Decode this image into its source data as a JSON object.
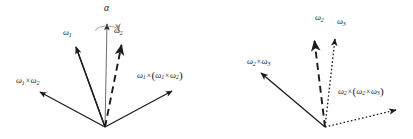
{
  "figure": {
    "background_color": "#ffffff",
    "ink_color": "#1a1a1a",
    "width": 413,
    "height": 139,
    "panels": [
      {
        "id": "left-panel",
        "origin": [
          105,
          127
        ],
        "axis": {
          "name": "alpha-axis",
          "label": "α",
          "tip": [
            107,
            22
          ],
          "style": "solid",
          "rotation_arc": true
        },
        "vectors": [
          {
            "name": "omega-1",
            "label_html": "ω<sub>1</sub>",
            "label_text": "ω1",
            "tip": [
              75,
              45
            ],
            "style": "solid",
            "label_pos": [
              63,
              30
            ]
          },
          {
            "name": "omega-2",
            "label_html": "ω<sub>2</sub>",
            "label_text": "ω2",
            "tip": [
              122,
              42
            ],
            "style": "dashed",
            "label_pos": [
              116,
              28
            ]
          },
          {
            "name": "omega-1-cross-omega-2",
            "label_html": "ω<sub>1</sub><span class=\"op\">×</span>ω<sub>2</sub>",
            "label_text": "ω1 × ω2",
            "tip": [
              37,
              95
            ],
            "style": "solid",
            "label_pos": [
              17,
              78
            ]
          },
          {
            "name": "omega-1-cross-omega-1-cross-omega-2",
            "label_html": "ω<sub>1</sub><span class=\"op\">×</span><span class=\"paren\">(</span>ω<sub>1</sub><span class=\"op\">×</span>ω<sub>2</sub><span class=\"paren\">)</span>",
            "label_text": "ω1 × (ω1 × ω2)",
            "tip": [
              175,
              93
            ],
            "style": "solid",
            "label_pos": [
              138,
              71
            ]
          }
        ]
      },
      {
        "id": "right-panel",
        "origin": [
          325,
          127
        ],
        "axis": null,
        "vectors": [
          {
            "name": "omega-2",
            "label_html": "ω<sub>2</sub>",
            "label_text": "ω2",
            "tip": [
              314,
              38
            ],
            "style": "dashed",
            "label_pos": [
              316,
              14
            ]
          },
          {
            "name": "omega-3",
            "label_html": "ω<sub>3</sub>",
            "label_text": "ω3",
            "tip": [
              336,
              36
            ],
            "style": "dotted",
            "label_pos": [
              338,
              17
            ]
          },
          {
            "name": "omega-2-cross-omega-3",
            "label_html": "ω<sub>2</sub><span class=\"op\">×</span>ω<sub>3</sub>",
            "label_text": "ω2 × ω3",
            "tip": [
              258,
              76
            ],
            "style": "solid",
            "label_pos": [
              248,
              58
            ]
          },
          {
            "name": "omega-2-cross-omega-2-cross-omega-3",
            "label_html": "ω<sub>2</sub><span class=\"op\">×</span><span class=\"paren\">(</span>ω<sub>2</sub><span class=\"op\">×</span>ω<sub>3</sub><span class=\"paren\">)</span>",
            "label_text": "ω2 × (ω2 × ω3)",
            "tip": [
              399,
              111
            ],
            "style": "dotted",
            "label_pos": [
              339,
              87
            ]
          }
        ]
      }
    ]
  }
}
